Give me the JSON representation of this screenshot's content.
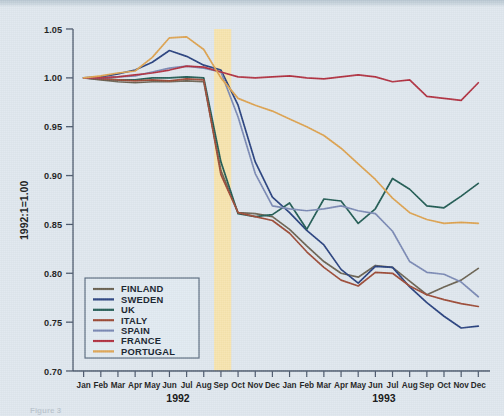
{
  "figure": {
    "caption_fragment": "Figure 3",
    "background_color": "#dfe7ee"
  },
  "chart_data": {
    "type": "line",
    "title": "",
    "subtitle": "",
    "xlabel": "",
    "ylabel": "1992:1=1.00",
    "ylim": [
      0.7,
      1.05
    ],
    "yticks": [
      "1.05",
      "1.00",
      "0.95",
      "0.90",
      "0.85",
      "0.80",
      "0.75",
      "0.70"
    ],
    "ytick_values": [
      1.05,
      1.0,
      0.95,
      0.9,
      0.85,
      0.8,
      0.75,
      0.7
    ],
    "grid": false,
    "legend_position": "lower-left-inside",
    "x": [
      "Jan",
      "Feb",
      "Mar",
      "Apr",
      "May",
      "Jun",
      "Jul",
      "Aug",
      "Sep",
      "Oct",
      "Nov",
      "Dec",
      "Jan",
      "Feb",
      "Mar",
      "Apr",
      "May",
      "Jun",
      "Jul",
      "Aug",
      "Sep",
      "Oct",
      "Nov",
      "Dec"
    ],
    "xtick_labels": [
      "Jan",
      "Feb",
      "Mar",
      "Apr",
      "May",
      "Jun",
      "Jul",
      "Aug",
      "Sep",
      "Oct",
      "Nov",
      "Dec",
      "Jan",
      "Feb",
      "Mar",
      "Apr",
      "May",
      "Jun",
      "Jul",
      "Aug",
      "Sep",
      "Oct",
      "Nov",
      "Dec"
    ],
    "period_labels": [
      {
        "label": "1992",
        "start_index": 0,
        "end_index": 11
      },
      {
        "label": "1993",
        "start_index": 12,
        "end_index": 23
      }
    ],
    "annotations": [
      {
        "type": "vspan",
        "name": "erm-crisis-band",
        "label": "",
        "start_index": 7.6,
        "end_index": 8.6,
        "color": "#fae3a6"
      }
    ],
    "series": [
      {
        "name": "FINLAND",
        "color": "#6a6252",
        "values": [
          1.0,
          0.998,
          0.996,
          0.995,
          0.996,
          0.996,
          0.997,
          0.996,
          0.905,
          0.862,
          0.861,
          0.858,
          0.845,
          0.828,
          0.812,
          0.8,
          0.796,
          0.808,
          0.806,
          0.792,
          0.778,
          0.786,
          0.793,
          0.805
        ]
      },
      {
        "name": "SWEDEN",
        "color": "#27407e",
        "values": [
          1.0,
          1.001,
          1.004,
          1.008,
          1.016,
          1.028,
          1.022,
          1.013,
          1.008,
          0.972,
          0.914,
          0.878,
          0.862,
          0.844,
          0.829,
          0.804,
          0.79,
          0.807,
          0.806,
          0.786,
          0.77,
          0.756,
          0.744,
          0.746
        ]
      },
      {
        "name": "UK",
        "color": "#1f5a52",
        "values": [
          1.0,
          0.999,
          0.998,
          0.998,
          1.0,
          1.0,
          1.001,
          1.0,
          0.914,
          0.861,
          0.858,
          0.86,
          0.872,
          0.845,
          0.876,
          0.874,
          0.851,
          0.866,
          0.897,
          0.886,
          0.869,
          0.867,
          0.879,
          0.892
        ]
      },
      {
        "name": "ITALY",
        "color": "#9c4a36",
        "values": [
          1.0,
          0.999,
          0.998,
          0.997,
          0.998,
          0.997,
          0.999,
          0.998,
          0.901,
          0.862,
          0.858,
          0.854,
          0.841,
          0.822,
          0.806,
          0.793,
          0.787,
          0.801,
          0.8,
          0.787,
          0.778,
          0.773,
          0.769,
          0.766
        ]
      },
      {
        "name": "SPAIN",
        "color": "#7a89b4",
        "values": [
          1.0,
          1.0,
          1.001,
          1.002,
          1.006,
          1.01,
          1.012,
          1.01,
          1.006,
          0.96,
          0.902,
          0.869,
          0.866,
          0.864,
          0.866,
          0.869,
          0.864,
          0.861,
          0.843,
          0.812,
          0.801,
          0.799,
          0.791,
          0.776
        ]
      },
      {
        "name": "FRANCE",
        "color": "#b03040",
        "values": [
          1.0,
          1.0,
          1.001,
          1.003,
          1.005,
          1.008,
          1.012,
          1.011,
          1.006,
          1.001,
          1.0,
          1.001,
          1.002,
          1.0,
          0.999,
          1.001,
          1.003,
          1.001,
          0.996,
          0.998,
          0.981,
          0.979,
          0.977,
          0.995
        ]
      },
      {
        "name": "PORTUGAL",
        "color": "#dda24f",
        "values": [
          1.0,
          1.002,
          1.005,
          1.007,
          1.021,
          1.041,
          1.042,
          1.029,
          1.0,
          0.979,
          0.972,
          0.966,
          0.958,
          0.95,
          0.941,
          0.928,
          0.912,
          0.896,
          0.877,
          0.862,
          0.855,
          0.851,
          0.852,
          0.851
        ]
      }
    ]
  },
  "legend": {
    "items": [
      {
        "label": "FINLAND",
        "color": "#6a6252"
      },
      {
        "label": "SWEDEN",
        "color": "#27407e"
      },
      {
        "label": "UK",
        "color": "#1f5a52"
      },
      {
        "label": "ITALY",
        "color": "#9c4a36"
      },
      {
        "label": "SPAIN",
        "color": "#7a89b4"
      },
      {
        "label": "FRANCE",
        "color": "#b03040"
      },
      {
        "label": "PORTUGAL",
        "color": "#dda24f"
      }
    ]
  }
}
